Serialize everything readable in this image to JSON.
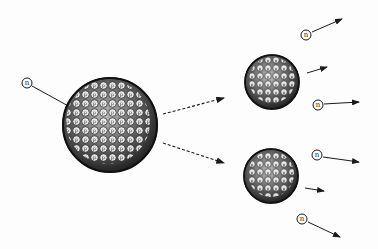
{
  "particle_label": "n",
  "nucleon_labels": [
    "p",
    "n"
  ],
  "colors": {
    "ink": "#1a1a1a",
    "background": "#fdfdfd",
    "nucleon_fill": "#f2f2f2"
  },
  "elements": {
    "incoming_neutron": {
      "label": "n"
    },
    "parent_nucleus": {
      "description": "large nucleus of packed protons and neutrons"
    },
    "fragment_upper": {
      "description": "fission fragment"
    },
    "fragment_lower": {
      "description": "fission fragment"
    },
    "released_neutrons": [
      {
        "label": "n"
      },
      {
        "label": "n"
      },
      {
        "label": "n"
      },
      {
        "label": "n"
      }
    ]
  }
}
